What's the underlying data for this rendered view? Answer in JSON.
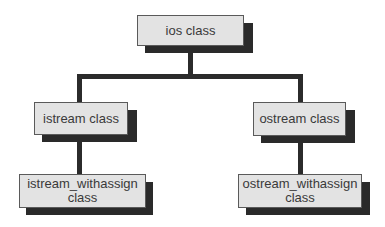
{
  "diagram": {
    "type": "class-hierarchy",
    "nodes": {
      "ios": {
        "line1": "ios class"
      },
      "istream": {
        "line1": "istream class"
      },
      "ostream": {
        "line1": "ostream class"
      },
      "istream_withassign": {
        "line1": "istream_withassign",
        "line2": "class"
      },
      "ostream_withassign": {
        "line1": "ostream_withassign",
        "line2": "class"
      }
    },
    "edges": [
      {
        "from": "ios",
        "to": "istream"
      },
      {
        "from": "ios",
        "to": "ostream"
      },
      {
        "from": "istream",
        "to": "istream_withassign"
      },
      {
        "from": "ostream",
        "to": "ostream_withassign"
      }
    ],
    "colors": {
      "box_fill": "#e3e3e3",
      "shadow": "#2a2a2a",
      "connector": "#2b2b2b",
      "text": "#3a3a3a"
    }
  }
}
